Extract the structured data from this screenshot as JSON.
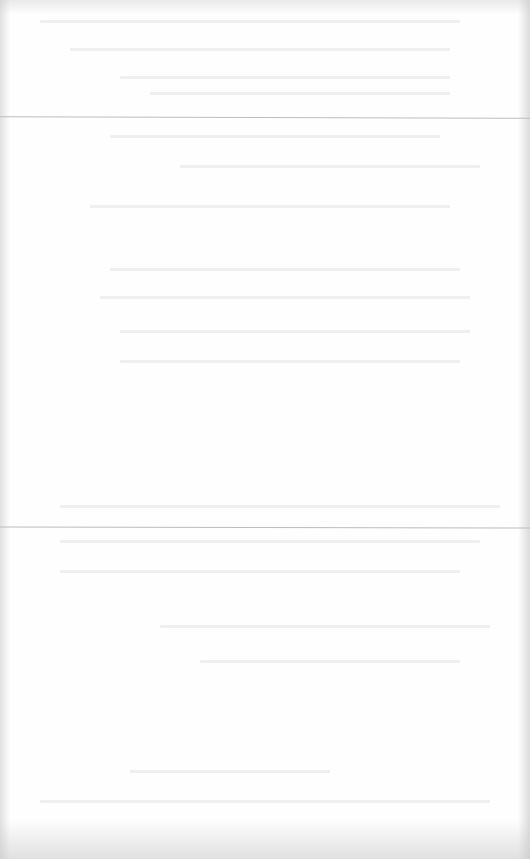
{
  "document": {
    "type": "scanned-page",
    "legible_text": [],
    "section_dividers": 2
  }
}
